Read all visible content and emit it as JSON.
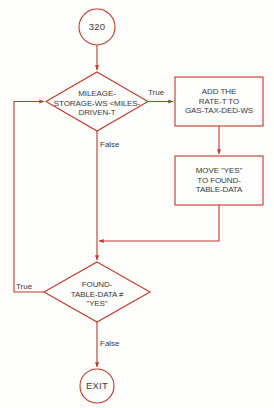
{
  "diagram": {
    "stroke_color": "#c0392b",
    "text_color": "#3b3b3b",
    "background_color": "#fdfdfc",
    "nodes": {
      "start": {
        "shape": "terminal-circle",
        "text": "320"
      },
      "decision_mileage": {
        "shape": "decision-diamond",
        "line1": "MILEAGE-",
        "line2": "STORAGE-WS <MILES-",
        "line3": "DRIVEN-T"
      },
      "process_add_rate": {
        "shape": "process-rectangle",
        "line1": "ADD THE",
        "line2": "RATE-T TO",
        "line3": "GAS-TAX-DED-WS"
      },
      "process_move_yes": {
        "shape": "process-rectangle",
        "line1": "MOVE \"YES\"",
        "line2": "TO FOUND-",
        "line3": "TABLE-DATA"
      },
      "decision_found": {
        "shape": "decision-diamond",
        "line1": "FOUND-",
        "line2": "TABLE-DATA ≠",
        "line3": "\"YES\""
      },
      "exit": {
        "shape": "terminal-circle",
        "text": "EXIT"
      }
    },
    "edge_labels": {
      "mileage_true": "True",
      "mileage_false": "False",
      "found_true": "True",
      "found_false": "False"
    }
  }
}
